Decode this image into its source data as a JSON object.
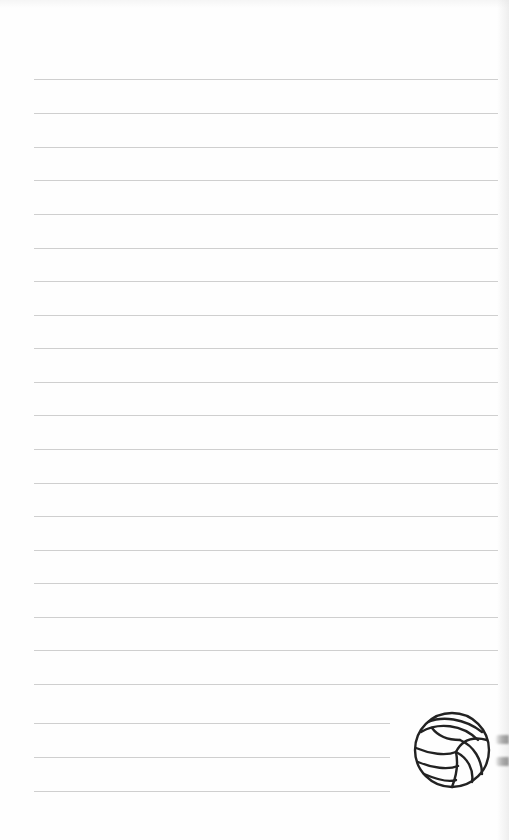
{
  "page": {
    "type": "lined-notebook-page",
    "background_color": "#fefefe",
    "rule_color": "#cfcfcf",
    "rules": [
      {
        "y": 79,
        "x1": 34,
        "x2": 498
      },
      {
        "y": 113,
        "x1": 34,
        "x2": 498
      },
      {
        "y": 147,
        "x1": 34,
        "x2": 498
      },
      {
        "y": 180,
        "x1": 34,
        "x2": 498
      },
      {
        "y": 214,
        "x1": 34,
        "x2": 498
      },
      {
        "y": 248,
        "x1": 34,
        "x2": 498
      },
      {
        "y": 281,
        "x1": 34,
        "x2": 498
      },
      {
        "y": 315,
        "x1": 34,
        "x2": 498
      },
      {
        "y": 348,
        "x1": 34,
        "x2": 498
      },
      {
        "y": 382,
        "x1": 34,
        "x2": 498
      },
      {
        "y": 415,
        "x1": 34,
        "x2": 498
      },
      {
        "y": 449,
        "x1": 34,
        "x2": 498
      },
      {
        "y": 483,
        "x1": 34,
        "x2": 498
      },
      {
        "y": 516,
        "x1": 34,
        "x2": 498
      },
      {
        "y": 550,
        "x1": 34,
        "x2": 498
      },
      {
        "y": 583,
        "x1": 34,
        "x2": 498
      },
      {
        "y": 617,
        "x1": 34,
        "x2": 498
      },
      {
        "y": 650,
        "x1": 34,
        "x2": 498
      },
      {
        "y": 684,
        "x1": 34,
        "x2": 498
      },
      {
        "y": 723,
        "x1": 34,
        "x2": 390
      },
      {
        "y": 757,
        "x1": 34,
        "x2": 390
      },
      {
        "y": 791,
        "x1": 34,
        "x2": 390
      }
    ],
    "decoration": {
      "icon": "volleyball-icon",
      "stroke_color": "#222222"
    }
  }
}
